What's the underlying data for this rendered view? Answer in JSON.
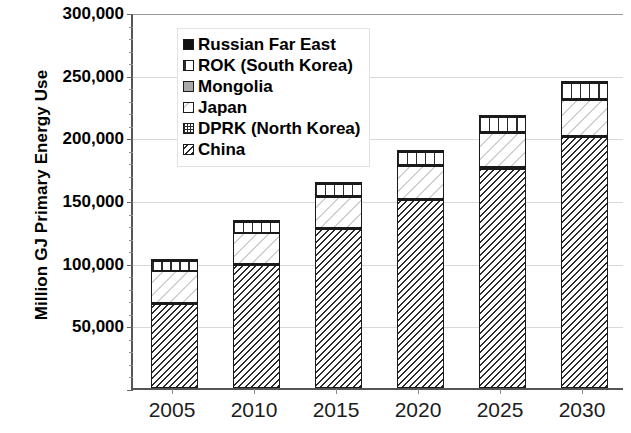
{
  "chart_data": {
    "type": "bar",
    "stacked": true,
    "title": "",
    "xlabel": "",
    "ylabel": "Million GJ Primary Energy Use",
    "categories": [
      "2005",
      "2010",
      "2015",
      "2020",
      "2025",
      "2030"
    ],
    "ylim": [
      0,
      300000
    ],
    "ytick_values": [
      0,
      50000,
      100000,
      150000,
      200000,
      250000,
      300000
    ],
    "ytick_labels": [
      "",
      "50,000",
      "100,000",
      "150,000",
      "200,000",
      "250,000",
      "300,000"
    ],
    "grid": true,
    "legend_position": "upper-left-inside",
    "series": [
      {
        "name": "China",
        "pattern": "diagonal-hatch-dense",
        "values": [
          67000,
          98000,
          127000,
          150000,
          175000,
          200000
        ]
      },
      {
        "name": "DPRK (North Korea)",
        "pattern": "checkerboard-grid",
        "values": [
          700,
          800,
          900,
          1000,
          1100,
          1200
        ]
      },
      {
        "name": "Japan",
        "pattern": "diagonal-hatch-light",
        "values": [
          25500,
          24500,
          24500,
          26500,
          27500,
          28500
        ]
      },
      {
        "name": "Mongolia",
        "pattern": "solid-gray",
        "values": [
          400,
          500,
          600,
          700,
          800,
          900
        ]
      },
      {
        "name": "ROK (South Korea)",
        "pattern": "vertical-stripes",
        "values": [
          7500,
          8500,
          9500,
          10500,
          11500,
          12500
        ]
      },
      {
        "name": "Russian Far East",
        "pattern": "solid-black",
        "values": [
          300,
          400,
          500,
          600,
          700,
          800
        ]
      }
    ],
    "totals": [
      101400,
      132700,
      163000,
      189300,
      216600,
      243900
    ]
  },
  "legend": {
    "entries": [
      {
        "label": "Russian Far East",
        "swatch": "solid-black"
      },
      {
        "label": "ROK (South Korea)",
        "swatch": "vertical-stripes"
      },
      {
        "label": "Mongolia",
        "swatch": "solid-gray"
      },
      {
        "label": "Japan",
        "swatch": "diagonal-hatch-light"
      },
      {
        "label": "DPRK (North Korea)",
        "swatch": "checkerboard-grid"
      },
      {
        "label": "China",
        "swatch": "diagonal-hatch-dense"
      }
    ]
  },
  "axes": {
    "y_title": "Million GJ Primary Energy Use"
  }
}
